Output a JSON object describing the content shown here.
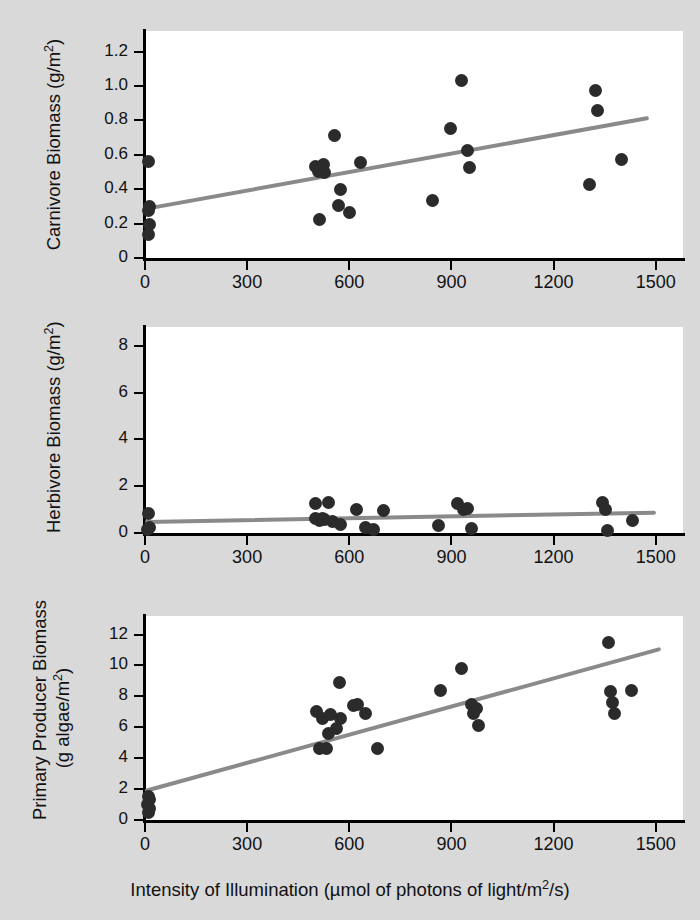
{
  "figure": {
    "background_color": "#d9d9d9",
    "plot_background_color": "#ffffff",
    "point_color": "#2b2b2b",
    "regression_line_color": "#8a8a8a",
    "axis_color": "#000000"
  },
  "xlabel": "Intensity of Illumination (µmol of photons of light/m²/s)",
  "chart_data": [
    {
      "type": "scatter",
      "title": "",
      "xlabel": "Intensity of Illumination (µmol of photons of light/m²/s)",
      "ylabel": "Carnivore Biomass (g/m²)",
      "ylabel_lines": [
        "Carnivore Biomass (g/m²)"
      ],
      "xlim": [
        0,
        1580
      ],
      "ylim": [
        0,
        1.32
      ],
      "xticks": [
        0,
        300,
        600,
        900,
        1200,
        1500
      ],
      "xticklabels": [
        "0",
        "300",
        "600",
        "900",
        "1200",
        "1500"
      ],
      "yticks": [
        0,
        0.2,
        0.4,
        0.6,
        0.8,
        1.0,
        1.2
      ],
      "yticklabels": [
        "0",
        "0.2",
        "0.4",
        "0.6",
        "0.8",
        "1.0",
        "1.2"
      ],
      "grid": false,
      "legend": "none",
      "points": [
        {
          "x": 10,
          "y": 0.56
        },
        {
          "x": 12,
          "y": 0.3
        },
        {
          "x": 10,
          "y": 0.275
        },
        {
          "x": 12,
          "y": 0.195
        },
        {
          "x": 10,
          "y": 0.135
        },
        {
          "x": 500,
          "y": 0.53
        },
        {
          "x": 510,
          "y": 0.505
        },
        {
          "x": 523,
          "y": 0.545
        },
        {
          "x": 528,
          "y": 0.5
        },
        {
          "x": 512,
          "y": 0.225
        },
        {
          "x": 556,
          "y": 0.71
        },
        {
          "x": 567,
          "y": 0.305
        },
        {
          "x": 573,
          "y": 0.4
        },
        {
          "x": 600,
          "y": 0.265
        },
        {
          "x": 632,
          "y": 0.555
        },
        {
          "x": 843,
          "y": 0.335
        },
        {
          "x": 898,
          "y": 0.755
        },
        {
          "x": 930,
          "y": 1.035
        },
        {
          "x": 948,
          "y": 0.625
        },
        {
          "x": 952,
          "y": 0.525
        },
        {
          "x": 1305,
          "y": 0.43
        },
        {
          "x": 1322,
          "y": 0.975
        },
        {
          "x": 1330,
          "y": 0.855
        },
        {
          "x": 1400,
          "y": 0.575
        }
      ],
      "regression": {
        "x0": 0,
        "y0": 0.285,
        "x1": 1480,
        "y1": 0.815
      }
    },
    {
      "type": "scatter",
      "title": "",
      "xlabel": "Intensity of Illumination (µmol of photons of light/m²/s)",
      "ylabel": "Herbivore Biomass (g/m²)",
      "ylabel_lines": [
        "Herbivore Biomass (g/m²)"
      ],
      "xlim": [
        0,
        1580
      ],
      "ylim": [
        0,
        8.8
      ],
      "xticks": [
        0,
        300,
        600,
        900,
        1200,
        1500
      ],
      "xticklabels": [
        "0",
        "300",
        "600",
        "900",
        "1200",
        "1500"
      ],
      "yticks": [
        0,
        2,
        4,
        6,
        8
      ],
      "yticklabels": [
        "0",
        "2",
        "4",
        "6",
        "8"
      ],
      "grid": false,
      "legend": "none",
      "points": [
        {
          "x": 10,
          "y": 0.85
        },
        {
          "x": 12,
          "y": 0.25
        },
        {
          "x": 8,
          "y": 0.15
        },
        {
          "x": 500,
          "y": 1.25
        },
        {
          "x": 502,
          "y": 0.6
        },
        {
          "x": 512,
          "y": 0.55
        },
        {
          "x": 522,
          "y": 0.62
        },
        {
          "x": 528,
          "y": 0.58
        },
        {
          "x": 538,
          "y": 1.3
        },
        {
          "x": 552,
          "y": 0.5
        },
        {
          "x": 575,
          "y": 0.35
        },
        {
          "x": 620,
          "y": 1.0
        },
        {
          "x": 648,
          "y": 0.25
        },
        {
          "x": 672,
          "y": 0.15
        },
        {
          "x": 700,
          "y": 0.95
        },
        {
          "x": 862,
          "y": 0.3
        },
        {
          "x": 918,
          "y": 1.25
        },
        {
          "x": 935,
          "y": 1.0
        },
        {
          "x": 948,
          "y": 1.05
        },
        {
          "x": 960,
          "y": 0.2
        },
        {
          "x": 1345,
          "y": 1.3
        },
        {
          "x": 1352,
          "y": 1.0
        },
        {
          "x": 1358,
          "y": 0.1
        },
        {
          "x": 1432,
          "y": 0.55
        }
      ],
      "regression": {
        "x0": 0,
        "y0": 0.45,
        "x1": 1500,
        "y1": 0.85
      }
    },
    {
      "type": "scatter",
      "title": "",
      "xlabel": "Intensity of Illumination (µmol of photons of light/m²/s)",
      "ylabel": "Primary Producer Biomass (g algae/m²)",
      "ylabel_lines": [
        "Primary Producer Biomass",
        "(g algae/m²)"
      ],
      "xlim": [
        0,
        1580
      ],
      "ylim": [
        0,
        13.2
      ],
      "xticks": [
        0,
        300,
        600,
        900,
        1200,
        1500
      ],
      "xticklabels": [
        "0",
        "300",
        "600",
        "900",
        "1200",
        "1500"
      ],
      "yticks": [
        0,
        2,
        4,
        6,
        8,
        10,
        12
      ],
      "yticklabels": [
        "0",
        "2",
        "4",
        "6",
        "8",
        "10",
        "12"
      ],
      "grid": false,
      "legend": false,
      "points": [
        {
          "x": 10,
          "y": 1.5
        },
        {
          "x": 14,
          "y": 1.3
        },
        {
          "x": 8,
          "y": 1.0
        },
        {
          "x": 12,
          "y": 0.75
        },
        {
          "x": 9,
          "y": 0.5
        },
        {
          "x": 505,
          "y": 7.0
        },
        {
          "x": 512,
          "y": 4.6
        },
        {
          "x": 520,
          "y": 6.6
        },
        {
          "x": 533,
          "y": 4.6
        },
        {
          "x": 538,
          "y": 5.6
        },
        {
          "x": 545,
          "y": 6.8
        },
        {
          "x": 562,
          "y": 5.9
        },
        {
          "x": 570,
          "y": 8.9
        },
        {
          "x": 575,
          "y": 6.6
        },
        {
          "x": 612,
          "y": 7.4
        },
        {
          "x": 625,
          "y": 7.5
        },
        {
          "x": 648,
          "y": 6.9
        },
        {
          "x": 683,
          "y": 4.6
        },
        {
          "x": 868,
          "y": 8.4
        },
        {
          "x": 930,
          "y": 9.8
        },
        {
          "x": 958,
          "y": 7.5
        },
        {
          "x": 965,
          "y": 6.9
        },
        {
          "x": 975,
          "y": 7.2
        },
        {
          "x": 978,
          "y": 6.1
        },
        {
          "x": 1360,
          "y": 11.5
        },
        {
          "x": 1368,
          "y": 8.3
        },
        {
          "x": 1372,
          "y": 7.6
        },
        {
          "x": 1378,
          "y": 6.9
        },
        {
          "x": 1428,
          "y": 8.4
        }
      ],
      "regression": {
        "x0": 0,
        "y0": 1.9,
        "x1": 1515,
        "y1": 11.1
      }
    }
  ]
}
